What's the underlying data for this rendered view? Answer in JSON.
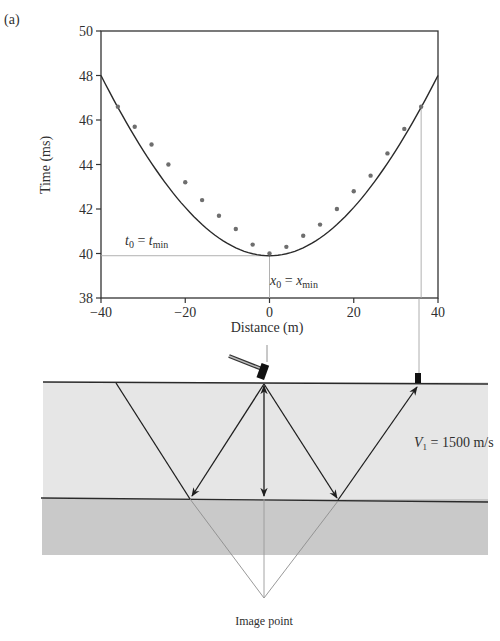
{
  "panel_label": "(a)",
  "chart_data": {
    "type": "scatter",
    "title": "",
    "xlabel": "Distance (m)",
    "ylabel": "Time (ms)",
    "xlim": [
      -40,
      40
    ],
    "ylim": [
      38,
      50
    ],
    "x_ticks": [
      -40,
      -20,
      0,
      20,
      40
    ],
    "x_tick_labels": [
      "−40",
      "−20",
      "0",
      "20",
      "40"
    ],
    "y_ticks": [
      38,
      40,
      42,
      44,
      46,
      48,
      50
    ],
    "y_tick_labels": [
      "38",
      "40",
      "42",
      "44",
      "46",
      "48",
      "50"
    ],
    "grid": false,
    "legend": "none",
    "series": [
      {
        "name": "Observed reflection arrivals",
        "type": "scatter",
        "x": [
          -36,
          -32,
          -28,
          -24,
          -20,
          -16,
          -12,
          -8,
          -4,
          0,
          4,
          8,
          12,
          16,
          20,
          24,
          28,
          32,
          36
        ],
        "y": [
          46.6,
          45.7,
          44.9,
          44.0,
          43.2,
          42.4,
          41.7,
          41.1,
          40.4,
          40.0,
          40.3,
          40.8,
          41.3,
          42.0,
          42.8,
          43.5,
          44.5,
          45.6,
          46.6
        ]
      },
      {
        "name": "Fitted hyperbola",
        "type": "line",
        "x": [
          -40,
          -30,
          -20,
          -10,
          0,
          10,
          20,
          30,
          40
        ],
        "y": [
          48.0,
          45.4,
          43.2,
          41.3,
          39.9,
          41.3,
          43.2,
          45.4,
          48.0
        ]
      }
    ],
    "annotations": [
      {
        "text_main": "t",
        "sub": "0",
        "eq": " = ",
        "text_main2": "t",
        "sub2": "min",
        "at": [
          -31,
          40.7
        ]
      },
      {
        "text_main": "x",
        "sub": "0",
        "eq": " = ",
        "text_main2": "x",
        "sub2": "min",
        "at": [
          1,
          39.3
        ]
      }
    ],
    "guide_lines": [
      {
        "from": [
          -40,
          39.9
        ],
        "to": [
          0,
          39.9
        ],
        "desc": "t0 = tmin horizontal guide"
      },
      {
        "from": [
          0,
          39.9
        ],
        "to": [
          0,
          38
        ],
        "desc": "x0 = xmin vertical guide"
      },
      {
        "from": [
          36,
          46.6
        ],
        "to": [
          36,
          38
        ],
        "desc": "geophone position guide"
      }
    ]
  },
  "diagram": {
    "velocity_label": {
      "main": "V",
      "sub": "1",
      "rest": " = 1500 m/s"
    },
    "image_point_label": "Image point",
    "source": "hammer",
    "receiver": "geophone",
    "layer_colors": {
      "upper": "#e6e6e6",
      "lower": "#c9c9c9",
      "line": "#2a2a2a",
      "guide": "#9a9a9a"
    }
  }
}
